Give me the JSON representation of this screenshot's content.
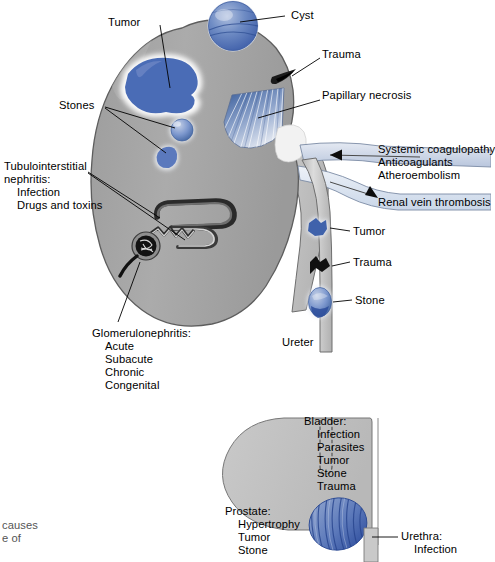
{
  "figure": {
    "type": "anatomical-diagram"
  },
  "colors": {
    "organ_grey": "#a9a9a9",
    "organ_grey_light": "#c6c6c6",
    "bladder_grey": "#c3c3c3",
    "lesion_blue": "#4a6cb6",
    "lesion_blue_dark": "#2f4e9e",
    "vessel_blue_pale": "#c9d6e8",
    "outline": "#4a4a4a",
    "text": "#000000",
    "background": "#ffffff"
  },
  "labels": {
    "tumor_upper": "Tumor",
    "cyst": "Cyst",
    "trauma_kidney": "Trauma",
    "papillary_necrosis": "Papillary necrosis",
    "stones": "Stones",
    "vessel_group": "Systemic coagulopathy\nAnticoagulants\nAtheroembolism",
    "vessel_line_1": "Systemic coagulopathy",
    "vessel_line_2": "Anticoagulants",
    "vessel_line_3": "Atheroembolism",
    "renal_vein_thrombosis": "Renal vein thrombosis",
    "tubulointerstitial_head": "Tubulointerstitial",
    "tubulointerstitial_head2": "nephritis:",
    "tubulointerstitial_items": [
      "Infection",
      "Drugs and toxins"
    ],
    "tumor_ureter": "Tumor",
    "trauma_ureter": "Trauma",
    "stone_ureter": "Stone",
    "ureter": "Ureter",
    "glomerulonephritis_head": "Glomerulonephritis:",
    "glomerulonephritis_items": [
      "Acute",
      "Subacute",
      "Chronic",
      "Congenital"
    ],
    "bladder_head": "Bladder:",
    "bladder_items": [
      "Infection",
      "Parasites",
      "Tumor",
      "Stone",
      "Trauma"
    ],
    "prostate_head": "Prostate:",
    "prostate_items": [
      "Hypertrophy",
      "Tumor",
      "Stone"
    ],
    "urethra_head": "Urethra:",
    "urethra_items": [
      "Infection"
    ],
    "caption_fragment_1": "causes",
    "caption_fragment_2": "e of"
  }
}
